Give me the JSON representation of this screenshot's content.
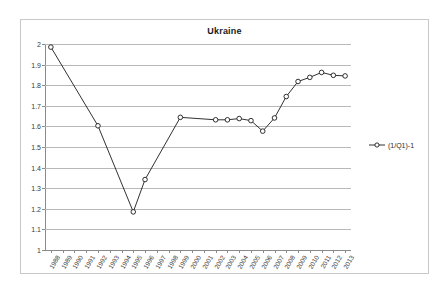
{
  "chart_data": {
    "type": "line",
    "title": "Ukraine",
    "xlabel": "",
    "ylabel": "",
    "ylim": [
      1,
      2
    ],
    "ytick_step": 0.1,
    "yticks": [
      "1",
      "1.1",
      "1.2",
      "1.3",
      "1.4",
      "1.5",
      "1.6",
      "1.7",
      "1.8",
      "1.9",
      "2"
    ],
    "grid": true,
    "legend_position": "right",
    "categories": [
      "1988",
      "1989",
      "1990",
      "1991",
      "1992",
      "1993",
      "1994",
      "1995",
      "1996",
      "1997",
      "1998",
      "1999",
      "2000",
      "2001",
      "2002",
      "2003",
      "2004",
      "2005",
      "2006",
      "2007",
      "2008",
      "2009",
      "2010",
      "2011",
      "2012",
      "2013"
    ],
    "series": [
      {
        "name": "(1/Q1)-1",
        "marker": "open-circle",
        "color": "#1a1a1a",
        "values": [
          1.985,
          null,
          null,
          null,
          1.603,
          null,
          null,
          1.185,
          1.342,
          null,
          null,
          1.644,
          null,
          null,
          1.632,
          1.632,
          1.638,
          1.628,
          1.577,
          1.641,
          1.745,
          1.818,
          1.838,
          1.862,
          1.848,
          1.845
        ]
      }
    ]
  },
  "legend": {
    "entries": [
      {
        "label": "(1/Q1)-1"
      }
    ]
  }
}
